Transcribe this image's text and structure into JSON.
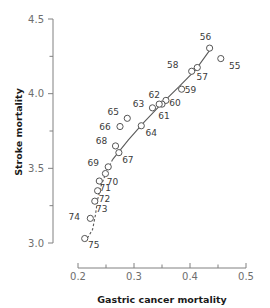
{
  "chart_data": {
    "type": "scatter",
    "title": "",
    "xlabel": "Gastric cancer mortality",
    "ylabel": "Stroke mortality",
    "xlim": [
      0.175,
      0.505
    ],
    "ylim": [
      2.96,
      4.52
    ],
    "grid": false,
    "legend": null,
    "xticks": [
      "0.2",
      "0.3",
      "0.4",
      "0.5"
    ],
    "xtick_values": [
      0.2,
      0.3,
      0.4,
      0.5
    ],
    "xminor_values": [
      0.25,
      0.35,
      0.45
    ],
    "yticks": [
      "4.5",
      "4.0",
      "3.5",
      "3.0"
    ],
    "ytick_values": [
      4.5,
      4.0,
      3.5,
      3.0
    ],
    "yminor_values": [
      4.25,
      3.75,
      3.25
    ],
    "point_label_key": "year",
    "points": [
      {
        "year": "55",
        "x": 0.455,
        "y": 4.235,
        "lx": 14,
        "ly": 10
      },
      {
        "year": "56",
        "x": 0.435,
        "y": 4.305,
        "lx": -4,
        "ly": -8
      },
      {
        "year": "57",
        "x": 0.413,
        "y": 4.175,
        "lx": 5,
        "ly": 12
      },
      {
        "year": "58",
        "x": 0.403,
        "y": 4.15,
        "lx": -19,
        "ly": -3
      },
      {
        "year": "59",
        "x": 0.385,
        "y": 4.03,
        "lx": 9,
        "ly": 4
      },
      {
        "year": "60",
        "x": 0.357,
        "y": 3.955,
        "lx": 9,
        "ly": 6
      },
      {
        "year": "61",
        "x": 0.35,
        "y": 3.93,
        "lx": 2,
        "ly": 15
      },
      {
        "year": "62",
        "x": 0.345,
        "y": 3.93,
        "lx": -5,
        "ly": -6
      },
      {
        "year": "63",
        "x": 0.333,
        "y": 3.905,
        "lx": -14,
        "ly": -1
      },
      {
        "year": "64",
        "x": 0.313,
        "y": 3.785,
        "lx": 10,
        "ly": 10
      },
      {
        "year": "65",
        "x": 0.288,
        "y": 3.835,
        "lx": -14,
        "ly": -3
      },
      {
        "year": "66",
        "x": 0.275,
        "y": 3.78,
        "lx": -15,
        "ly": 3
      },
      {
        "year": "67",
        "x": 0.273,
        "y": 3.605,
        "lx": 9,
        "ly": 10
      },
      {
        "year": "68",
        "x": 0.267,
        "y": 3.65,
        "lx": -14,
        "ly": -2
      },
      {
        "year": "69",
        "x": 0.254,
        "y": 3.51,
        "lx": -15,
        "ly": -1
      },
      {
        "year": "70",
        "x": 0.249,
        "y": 3.465,
        "lx": 7,
        "ly": 11
      },
      {
        "year": "71",
        "x": 0.238,
        "y": 3.415,
        "lx": 6,
        "ly": 10
      },
      {
        "year": "72",
        "x": 0.235,
        "y": 3.35,
        "lx": 7,
        "ly": 11
      },
      {
        "year": "73",
        "x": 0.23,
        "y": 3.28,
        "lx": 7,
        "ly": 11
      },
      {
        "year": "74",
        "x": 0.222,
        "y": 3.165,
        "lx": -16,
        "ly": 2
      },
      {
        "year": "75",
        "x": 0.212,
        "y": 3.03,
        "lx": 9,
        "ly": 9
      }
    ],
    "trend_solid": [
      {
        "x": 0.262,
        "y": 3.56
      },
      {
        "x": 0.29,
        "y": 3.69
      },
      {
        "x": 0.318,
        "y": 3.81
      },
      {
        "x": 0.35,
        "y": 3.935
      },
      {
        "x": 0.38,
        "y": 4.045
      },
      {
        "x": 0.41,
        "y": 4.16
      },
      {
        "x": 0.437,
        "y": 4.3
      }
    ],
    "trend_dashed": [
      {
        "x": 0.262,
        "y": 3.56
      },
      {
        "x": 0.25,
        "y": 3.47
      },
      {
        "x": 0.241,
        "y": 3.38
      },
      {
        "x": 0.235,
        "y": 3.29
      },
      {
        "x": 0.231,
        "y": 3.185
      },
      {
        "x": 0.226,
        "y": 3.09
      },
      {
        "x": 0.216,
        "y": 3.028
      }
    ],
    "colors": {
      "marker_stroke": "#555555",
      "marker_fill": "#ffffff",
      "trend": "#5a5a5a",
      "axis": "#808080",
      "tick_text": "#6e6e6e",
      "axis_title": "#1a1a1a",
      "point_label": "#3a3a3a",
      "background": "#ffffff"
    }
  }
}
